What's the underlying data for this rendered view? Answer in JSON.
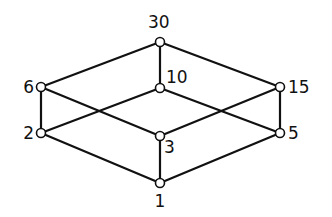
{
  "diagram": {
    "type": "hasse-diagram",
    "colors": {
      "line": "#111111",
      "node_fill": "#ffffff",
      "background": "#ffffff"
    },
    "nodes": [
      {
        "id": "30",
        "label": "30",
        "x": 160,
        "y": 42,
        "lx": 148,
        "ly": 28,
        "anchor": "start"
      },
      {
        "id": "6",
        "label": "6",
        "x": 41,
        "y": 87,
        "lx": 34,
        "ly": 93,
        "anchor": "end"
      },
      {
        "id": "10",
        "label": "10",
        "x": 160,
        "y": 88,
        "lx": 166,
        "ly": 83,
        "anchor": "start"
      },
      {
        "id": "15",
        "label": "15",
        "x": 280,
        "y": 87,
        "lx": 288,
        "ly": 93,
        "anchor": "start"
      },
      {
        "id": "2",
        "label": "2",
        "x": 41,
        "y": 133,
        "lx": 34,
        "ly": 139,
        "anchor": "end"
      },
      {
        "id": "3",
        "label": "3",
        "x": 160,
        "y": 136,
        "lx": 164,
        "ly": 153,
        "anchor": "start"
      },
      {
        "id": "5",
        "label": "5",
        "x": 280,
        "y": 133,
        "lx": 288,
        "ly": 139,
        "anchor": "start"
      },
      {
        "id": "1",
        "label": "1",
        "x": 160,
        "y": 183,
        "lx": 160,
        "ly": 207,
        "anchor": "middle"
      }
    ],
    "edges": [
      [
        "1",
        "2"
      ],
      [
        "1",
        "3"
      ],
      [
        "1",
        "5"
      ],
      [
        "2",
        "6"
      ],
      [
        "2",
        "10"
      ],
      [
        "3",
        "6"
      ],
      [
        "3",
        "15"
      ],
      [
        "5",
        "10"
      ],
      [
        "5",
        "15"
      ],
      [
        "6",
        "30"
      ],
      [
        "10",
        "30"
      ],
      [
        "15",
        "30"
      ]
    ]
  }
}
